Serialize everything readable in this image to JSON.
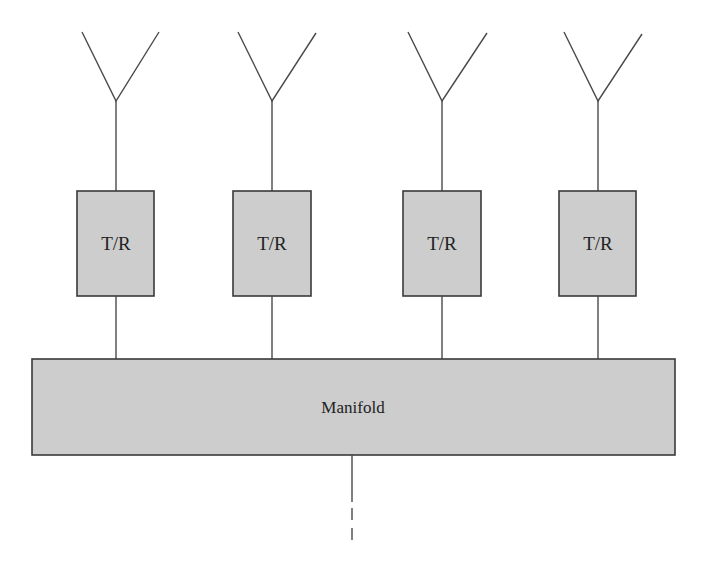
{
  "diagram": {
    "type": "phased-array-block-diagram",
    "colors": {
      "box_fill": "#cdcdcd",
      "stroke": "#3a3a3a",
      "background": "#ffffff"
    },
    "elements": [
      {
        "id": "element-1",
        "antenna": "antenna-icon",
        "module_label": "T/R",
        "center_x": 116
      },
      {
        "id": "element-2",
        "antenna": "antenna-icon",
        "module_label": "T/R",
        "center_x": 272
      },
      {
        "id": "element-3",
        "antenna": "antenna-icon",
        "module_label": "T/R",
        "center_x": 442
      },
      {
        "id": "element-4",
        "antenna": "antenna-icon",
        "module_label": "T/R",
        "center_x": 598
      }
    ],
    "manifold": {
      "label": "Manifold"
    },
    "feed_line": {
      "style": "solid-then-dashed"
    }
  }
}
